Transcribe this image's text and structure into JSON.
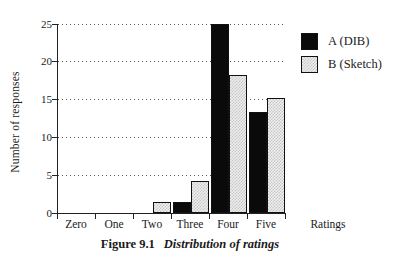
{
  "chart_data": {
    "type": "bar",
    "ylabel": "Number of responses",
    "xlabel": "Ratings",
    "categories": [
      "Zero",
      "One",
      "Two",
      "Three",
      "Four",
      "Five"
    ],
    "series": [
      {
        "name": "A (DIB)",
        "style": "solid",
        "color": "#0a0a0a",
        "values": [
          0,
          0,
          0,
          1.5,
          25,
          13.3
        ]
      },
      {
        "name": "B (Sketch)",
        "style": "checker",
        "color": "#d6d6d6",
        "values": [
          0,
          0,
          1.5,
          4.2,
          18.2,
          15.2
        ]
      }
    ],
    "yticks": [
      0,
      5,
      10,
      15,
      20,
      25
    ],
    "ylim": [
      0,
      25
    ],
    "grid": "horizontal-dotted",
    "legend_position": "right-top",
    "caption": {
      "label": "Figure 9.1",
      "text": "Distribution of ratings"
    }
  }
}
